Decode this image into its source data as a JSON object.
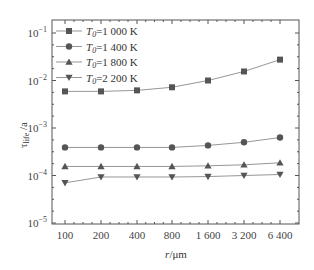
{
  "chart_data": {
    "type": "line",
    "title": "",
    "xlabel": "r/μm",
    "ylabel": "τ_life /a",
    "x_scale": "categorical (log2 spaced)",
    "y_scale": "log",
    "ylim": [
      1e-05,
      0.2
    ],
    "categories": [
      "100",
      "200",
      "400",
      "800",
      "1 600",
      "3 200",
      "6 400"
    ],
    "y_ticks": [
      {
        "value": 0.1,
        "label_base": "10",
        "label_exp": "-1"
      },
      {
        "value": 0.01,
        "label_base": "10",
        "label_exp": "-2"
      },
      {
        "value": 0.001,
        "label_base": "10",
        "label_exp": "-3"
      },
      {
        "value": 0.0001,
        "label_base": "10",
        "label_exp": "-4"
      },
      {
        "value": 1e-05,
        "label_base": "10",
        "label_exp": "-5"
      }
    ],
    "legend_position": "upper left",
    "grid": false,
    "series": [
      {
        "name": "T0=1 000 K",
        "label_var": "T",
        "label_sub": "0",
        "label_rest": "=1 000 K",
        "marker": "square",
        "values": [
          0.0059,
          0.0059,
          0.0062,
          0.0072,
          0.01,
          0.0155,
          0.0275
        ]
      },
      {
        "name": "T0=1 400 K",
        "label_var": "T",
        "label_sub": "0",
        "label_rest": "=1 400 K",
        "marker": "circle",
        "values": [
          0.00039,
          0.00039,
          0.00039,
          0.00039,
          0.00043,
          0.0005,
          0.00063
        ]
      },
      {
        "name": "T0=1 800 K",
        "label_var": "T",
        "label_sub": "0",
        "label_rest": "=1 800 K",
        "marker": "triangle-up",
        "values": [
          0.000155,
          0.000155,
          0.000155,
          0.000155,
          0.00016,
          0.000168,
          0.000185
        ]
      },
      {
        "name": "T0=2 200 K",
        "label_var": "T",
        "label_sub": "0",
        "label_rest": "=2 200 K",
        "marker": "triangle-down",
        "values": [
          7e-05,
          9.3e-05,
          9.3e-05,
          9.3e-05,
          9.5e-05,
          0.0001,
          0.000105
        ]
      }
    ]
  },
  "colors": {
    "axis": "#555555",
    "line": "#8a8a8a",
    "marker": "#555555"
  }
}
